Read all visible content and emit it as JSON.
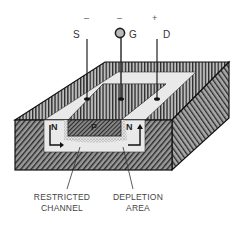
{
  "terminals": [
    {
      "label": "S",
      "polarity": "–"
    },
    {
      "label": "G",
      "polarity": "–"
    },
    {
      "label": "D",
      "polarity": "+"
    }
  ],
  "regions": {
    "source_region": "N",
    "gate_region": "P",
    "drain_region": "N"
  },
  "callouts": {
    "restricted_channel": [
      "RESTRICTED",
      "CHANNEL"
    ],
    "depletion_area": [
      "DEPLETION",
      "AREA"
    ]
  },
  "colors": {
    "ink": "#1a1a1a",
    "body_fill": "#6e6e6e",
    "channel_fill": "#e6e6e6",
    "depletion_fill": "#cfcfcf"
  }
}
